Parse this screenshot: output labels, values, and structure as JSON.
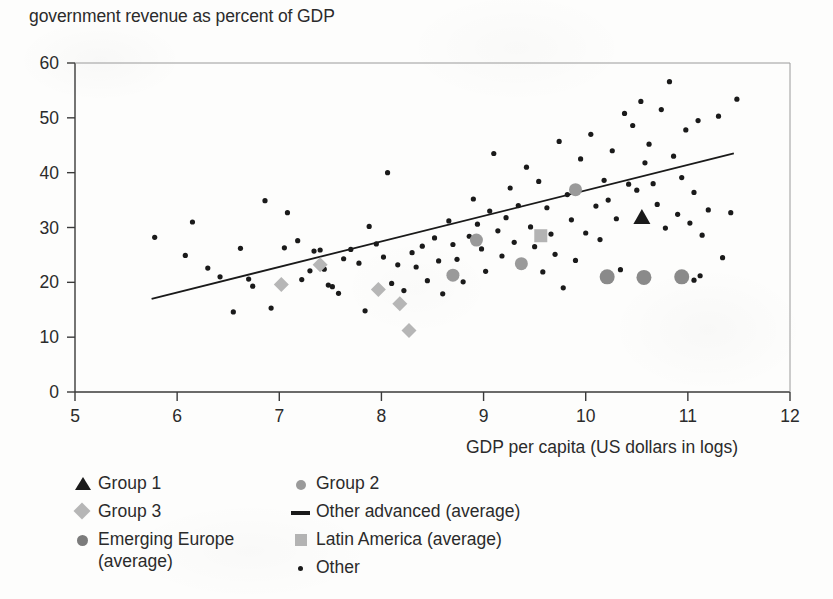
{
  "title": "government revenue as percent of GDP",
  "axes": {
    "x_title": "GDP per capita (US dollars in logs)",
    "x_ticks": [
      "5",
      "6",
      "7",
      "8",
      "9",
      "10",
      "11",
      "12"
    ],
    "y_ticks": [
      "0",
      "10",
      "20",
      "30",
      "40",
      "50",
      "60"
    ]
  },
  "legend": {
    "left": [
      {
        "marker": "triangle-black",
        "label": "Group 1"
      },
      {
        "marker": "diamond-gray",
        "label": "Group 3"
      },
      {
        "marker": "circle-dark-gray",
        "label": "Emerging Europe\n(average)"
      }
    ],
    "right": [
      {
        "marker": "circle-mid-gray",
        "label": "Group 2"
      },
      {
        "marker": "line-black",
        "label": "Other advanced (average)"
      },
      {
        "marker": "square-gray",
        "label": "Latin America (average)"
      },
      {
        "marker": "dot-black",
        "label": "Other"
      }
    ]
  },
  "colors": {
    "ink": "#1a1a1a",
    "text": "#2b2b2b",
    "axis": "#3a3a3a",
    "gray_marker": "#b3b3b3",
    "mid_gray_marker": "#9a9a9a",
    "dark_gray_marker": "#7b7b7b",
    "paper": "#fdfdfc"
  },
  "chart_data": {
    "type": "scatter",
    "title": "government revenue as percent of GDP",
    "xlabel": "GDP per capita (US dollars in logs)",
    "ylabel": "government revenue as percent of GDP",
    "xlim": [
      5,
      12
    ],
    "ylim": [
      0,
      60
    ],
    "xticks": [
      5,
      6,
      7,
      8,
      9,
      10,
      11,
      12
    ],
    "yticks": [
      0,
      10,
      20,
      30,
      40,
      50,
      60
    ],
    "grid": false,
    "legend_position": "below-plot",
    "trendline": {
      "name": "Other advanced (average)",
      "x": [
        5.75,
        11.45
      ],
      "y": [
        17.0,
        43.5
      ],
      "color": "#1a1a1a",
      "width": 1.8
    },
    "series": [
      {
        "name": "Other",
        "marker": "dot",
        "color": "#1a1a1a",
        "size": 5.2,
        "points": [
          [
            5.78,
            28.2
          ],
          [
            6.08,
            24.9
          ],
          [
            6.15,
            31.0
          ],
          [
            6.3,
            22.6
          ],
          [
            6.42,
            21.0
          ],
          [
            6.55,
            14.6
          ],
          [
            6.62,
            26.2
          ],
          [
            6.7,
            20.6
          ],
          [
            6.74,
            19.3
          ],
          [
            6.86,
            34.9
          ],
          [
            6.92,
            15.3
          ],
          [
            7.05,
            26.3
          ],
          [
            7.08,
            32.7
          ],
          [
            7.18,
            27.6
          ],
          [
            7.22,
            20.5
          ],
          [
            7.3,
            22.1
          ],
          [
            7.34,
            25.7
          ],
          [
            7.4,
            25.9
          ],
          [
            7.44,
            22.4
          ],
          [
            7.48,
            19.5
          ],
          [
            7.52,
            19.2
          ],
          [
            7.58,
            18.0
          ],
          [
            7.63,
            24.3
          ],
          [
            7.7,
            26.0
          ],
          [
            7.78,
            23.5
          ],
          [
            7.84,
            14.8
          ],
          [
            7.88,
            30.2
          ],
          [
            7.95,
            27.0
          ],
          [
            8.02,
            24.6
          ],
          [
            8.06,
            40.0
          ],
          [
            8.1,
            19.8
          ],
          [
            8.16,
            23.2
          ],
          [
            8.22,
            18.5
          ],
          [
            8.3,
            25.4
          ],
          [
            8.34,
            22.8
          ],
          [
            8.4,
            26.6
          ],
          [
            8.45,
            20.3
          ],
          [
            8.52,
            28.1
          ],
          [
            8.56,
            23.9
          ],
          [
            8.6,
            17.9
          ],
          [
            8.66,
            31.2
          ],
          [
            8.7,
            26.9
          ],
          [
            8.74,
            24.2
          ],
          [
            8.8,
            20.1
          ],
          [
            8.86,
            28.4
          ],
          [
            8.9,
            35.2
          ],
          [
            8.94,
            30.6
          ],
          [
            8.98,
            26.1
          ],
          [
            9.02,
            22.0
          ],
          [
            9.06,
            33.0
          ],
          [
            9.1,
            43.5
          ],
          [
            9.14,
            29.4
          ],
          [
            9.18,
            24.8
          ],
          [
            9.22,
            31.8
          ],
          [
            9.26,
            37.2
          ],
          [
            9.3,
            27.3
          ],
          [
            9.34,
            34.0
          ],
          [
            9.38,
            23.6
          ],
          [
            9.42,
            41.0
          ],
          [
            9.46,
            30.1
          ],
          [
            9.5,
            26.5
          ],
          [
            9.54,
            38.4
          ],
          [
            9.58,
            21.9
          ],
          [
            9.62,
            33.6
          ],
          [
            9.66,
            28.8
          ],
          [
            9.7,
            25.1
          ],
          [
            9.74,
            45.7
          ],
          [
            9.78,
            19.0
          ],
          [
            9.82,
            36.0
          ],
          [
            9.86,
            31.4
          ],
          [
            9.9,
            24.0
          ],
          [
            9.95,
            42.5
          ],
          [
            10.0,
            29.0
          ],
          [
            10.05,
            47.0
          ],
          [
            10.1,
            33.9
          ],
          [
            10.14,
            27.8
          ],
          [
            10.18,
            38.6
          ],
          [
            10.22,
            35.0
          ],
          [
            10.26,
            44.0
          ],
          [
            10.3,
            31.6
          ],
          [
            10.34,
            22.3
          ],
          [
            10.38,
            50.8
          ],
          [
            10.42,
            37.9
          ],
          [
            10.46,
            48.6
          ],
          [
            10.5,
            36.8
          ],
          [
            10.54,
            53.0
          ],
          [
            10.58,
            41.8
          ],
          [
            10.62,
            45.2
          ],
          [
            10.66,
            38.0
          ],
          [
            10.7,
            34.2
          ],
          [
            10.74,
            51.5
          ],
          [
            10.78,
            29.9
          ],
          [
            10.82,
            56.6
          ],
          [
            10.86,
            43.0
          ],
          [
            10.9,
            32.4
          ],
          [
            10.94,
            39.1
          ],
          [
            10.98,
            47.8
          ],
          [
            11.02,
            30.8
          ],
          [
            11.06,
            36.4
          ],
          [
            11.1,
            49.5
          ],
          [
            11.14,
            28.6
          ],
          [
            11.2,
            33.2
          ],
          [
            11.3,
            50.3
          ],
          [
            11.42,
            32.7
          ],
          [
            11.48,
            53.4
          ],
          [
            11.34,
            24.5
          ],
          [
            11.12,
            21.2
          ],
          [
            11.06,
            20.4
          ]
        ]
      },
      {
        "name": "Group 1",
        "marker": "triangle",
        "color": "#1a1a1a",
        "size": 17,
        "points": [
          [
            10.55,
            32.0
          ]
        ]
      },
      {
        "name": "Group 2",
        "marker": "circle",
        "color": "#9a9a9a",
        "size": 13,
        "points": [
          [
            8.7,
            21.3
          ],
          [
            8.93,
            27.7
          ],
          [
            9.37,
            23.4
          ],
          [
            9.9,
            36.9
          ]
        ]
      },
      {
        "name": "Group 3",
        "marker": "diamond",
        "color": "#b6b6b6",
        "size": 15,
        "points": [
          [
            7.02,
            19.6
          ],
          [
            7.4,
            23.2
          ],
          [
            7.97,
            18.7
          ],
          [
            8.18,
            16.1
          ],
          [
            8.27,
            11.2
          ]
        ]
      },
      {
        "name": "Emerging Europe (average)",
        "marker": "circle",
        "color": "#8a8a8a",
        "size": 15,
        "points": [
          [
            10.21,
            21.0
          ],
          [
            10.57,
            20.9
          ],
          [
            10.94,
            21.0
          ]
        ]
      },
      {
        "name": "Latin America (average)",
        "marker": "square",
        "color": "#b3b3b3",
        "size": 13,
        "points": [
          [
            9.56,
            28.5
          ]
        ]
      }
    ]
  }
}
